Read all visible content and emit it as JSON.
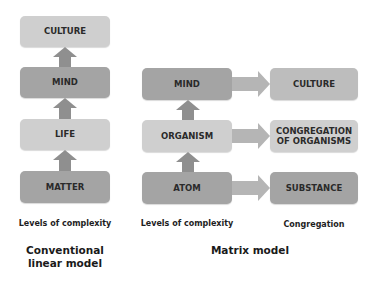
{
  "linear_model": {
    "boxes": [
      "CULTURE",
      "MIND",
      "LIFE",
      "MATTER"
    ],
    "axis_label": "Levels of complexity",
    "title": "Conventional linear model"
  },
  "matrix_model": {
    "levels": [
      "MIND",
      "ORGANISM",
      "ATOM"
    ],
    "congregations": [
      "CULTURE",
      "CONGREGATION OF ORGANISMS",
      "SUBSTANCE"
    ],
    "levels_label": "Levels of complexity",
    "congregation_label": "Congregation",
    "title": "Matrix model"
  },
  "colors": {
    "light_box": "#cfcfcf",
    "mid_box": "#bdbdbd",
    "dark_box": "#a4a4a4",
    "arrow": "#8f8f8f"
  }
}
